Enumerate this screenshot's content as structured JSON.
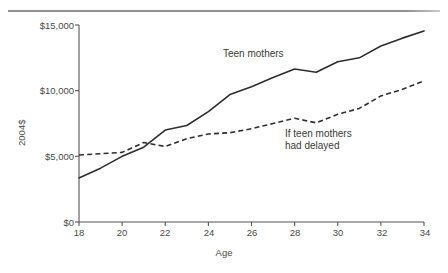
{
  "chart_data": {
    "type": "line",
    "title": "",
    "xlabel": "Age",
    "ylabel": "2004$",
    "x": [
      18,
      19,
      20,
      21,
      22,
      23,
      24,
      25,
      26,
      27,
      28,
      29,
      30,
      31,
      32,
      33,
      34
    ],
    "xlim": [
      18,
      34
    ],
    "ylim": [
      0,
      15000
    ],
    "xticks": [
      18,
      20,
      22,
      24,
      26,
      28,
      30,
      32,
      34
    ],
    "xtick_labels": [
      "18",
      "20",
      "22",
      "24",
      "26",
      "28",
      "30",
      "32",
      "34"
    ],
    "yticks": [
      0,
      5000,
      10000,
      15000
    ],
    "ytick_labels": [
      "$0",
      "$5,000",
      "$10,000",
      "$15,000"
    ],
    "grid": false,
    "legend_position": "inline-annotations",
    "series": [
      {
        "name": "Teen mothers",
        "style": "solid",
        "color": "#2e2e2e",
        "values": [
          3350,
          4100,
          5000,
          5700,
          7000,
          7350,
          8400,
          9700,
          10300,
          11000,
          11650,
          11400,
          12200,
          12500,
          13400,
          14000,
          14550
        ]
      },
      {
        "name": "If teen mothers had delayed",
        "style": "dashed",
        "color": "#2e2e2e",
        "values": [
          5100,
          5200,
          5300,
          6050,
          5750,
          6350,
          6700,
          6800,
          7100,
          7500,
          7900,
          7550,
          8200,
          8650,
          9600,
          10100,
          10750
        ]
      }
    ],
    "annotations": [
      {
        "text": "Teen mothers",
        "x": 26,
        "y": 12600
      },
      {
        "text": "If teen mothers\nhad delayed",
        "x": 29.5,
        "y": 7300
      }
    ]
  },
  "footnote": {
    "text": ""
  }
}
